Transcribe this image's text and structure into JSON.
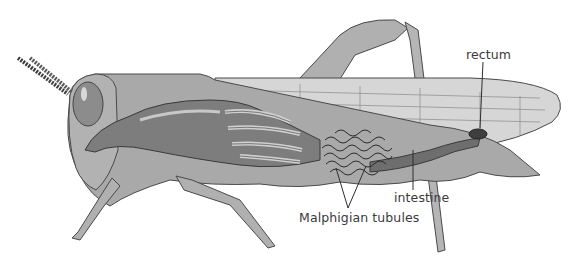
{
  "diagram": {
    "labels": [
      {
        "id": "rectum",
        "text": "rectum",
        "x": 516,
        "y": 48
      },
      {
        "id": "intestine",
        "text": "intestine",
        "x": 398,
        "y": 192
      },
      {
        "id": "malphigian",
        "text": "Malphigian tubules",
        "x": 300,
        "y": 212
      }
    ],
    "colors": {
      "body": "#a9a9a9",
      "body_light": "#c4c4c4",
      "outline": "#4a4a4a",
      "gut": "#7d7d7d",
      "tubules": "#2b2b2b",
      "wing": "#d6d6d6",
      "text": "#3a3a3a",
      "background": "#ffffff"
    }
  }
}
